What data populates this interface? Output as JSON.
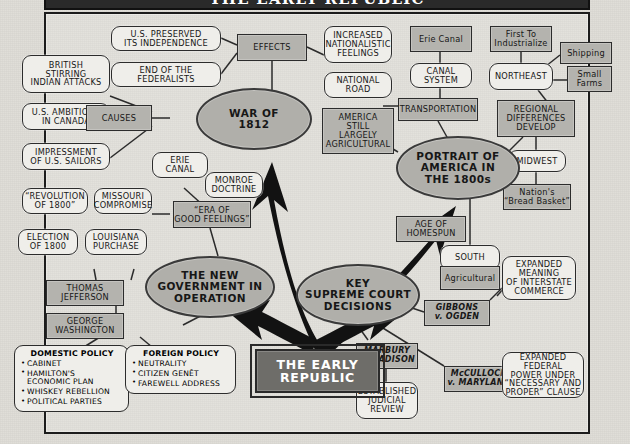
{
  "title": "THE EARLY REPUBLIC",
  "colors": {
    "paper": "#dedcd6",
    "bubble_fill": "#efeeea",
    "box_fill": "#b4b3ae",
    "hub_fill": "#b0afaa",
    "core_fill": "#6e6d69",
    "ink": "#171717",
    "arrow": "#111111"
  },
  "core": {
    "label": "THE EARLY\nREPUBLIC"
  },
  "hubs": {
    "war": "WAR OF\n1812",
    "portrait": "PORTRAIT OF\nAMERICA IN\nTHE 1800s",
    "government": "THE NEW\nGOVERNMENT IN\nOPERATION",
    "court": "KEY\nSUPREME COURT\nDECISIONS"
  },
  "war_branch": {
    "effects": "EFFECTS",
    "causes": "CAUSES",
    "preserved_independence": "U.S. PRESERVED\nITS INDEPENDENCE",
    "end_federalists": "END OF THE\nFEDERALISTS",
    "nationalistic": "INCREASED\nNATIONALISTIC\nFEELINGS",
    "british_stirring": "BRITISH\nSTIRRING\nINDIAN ATTACKS",
    "us_ambitions": "U.S. AMBITIONS\nIN CANADA",
    "impressment": "IMPRESSMENT\nOF U.S. SAILORS"
  },
  "portrait_branch": {
    "transportation": "TRANSPORTATION",
    "canal_system": "CANAL\nSYSTEM",
    "erie_canal": "Erie Canal",
    "national_road": "NATIONAL\nROAD",
    "america_agricultural": "AMERICA\nSTILL\nLARGELY\nAGRICULTURAL",
    "age_of_homespun": "AGE OF\nHOMESPUN",
    "regional_differences": "REGIONAL\nDIFFERENCES\nDEVELOP",
    "northeast": "NORTHEAST",
    "first_to_industrialize": "First To\nIndustrialize",
    "shipping": "Shipping",
    "small_farms": "Small\nFarms",
    "midwest": "MIDWEST",
    "bread_basket": "Nation's\n“Bread Basket”",
    "south": "SOUTH",
    "agricultural": "Agricultural"
  },
  "government_branch": {
    "era_good_feelings": "“ERA OF\nGOOD FEELINGS”",
    "erie_canal": "ERIE\nCANAL",
    "monroe_doctrine": "MONROE\nDOCTRINE",
    "missouri_compromise": "MISSOURI\nCOMPROMISE",
    "revolution_1800": "“REVOLUTION\nOF 1800”",
    "election_1800": "ELECTION\nOF 1800",
    "louisiana_purchase": "LOUISIANA\nPURCHASE",
    "thomas_jefferson": "THOMAS\nJEFFERSON",
    "george_washington": "GEORGE\nWASHINGTON",
    "domestic_policy": {
      "heading": "DOMESTIC POLICY",
      "items": [
        "CABINET",
        "HAMILTON'S\nECONOMIC PLAN",
        "WHISKEY REBELLION",
        "POLITICAL PARTIES"
      ]
    },
    "foreign_policy": {
      "heading": "FOREIGN POLICY",
      "items": [
        "NEUTRALITY",
        "CITIZEN GENÊT",
        "FAREWELL ADDRESS"
      ]
    }
  },
  "court_branch": {
    "marbury": "MARBURY\nv. MADISON",
    "judicial_review": "ESTABLISHED\nJUDICIAL\nREVIEW",
    "gibbons": "GIBBONS\nv. OGDEN",
    "interstate_commerce": "EXPANDED\nMEANING\nOF INTERSTATE\nCOMMERCE",
    "mcculloch": "McCULLOCH\nv. MARYLAND",
    "federal_power": "EXPANDED FEDERAL\nPOWER UNDER\n“NECESSARY AND\nPROPER” CLAUSE"
  }
}
